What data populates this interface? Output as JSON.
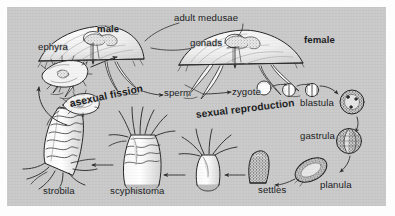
{
  "figure": {
    "panel_background": "#c9c9c9",
    "ink_color": "#1a1a1a",
    "paper_background": "#fdfdfd"
  },
  "labels": {
    "ephyra": {
      "text": "ephyra",
      "style": "regular",
      "x": 38,
      "y": 42
    },
    "male": {
      "text": "male",
      "style": "bold",
      "x": 97,
      "y": 24
    },
    "adult_medusae": {
      "text": "adult medusae",
      "style": "regular",
      "x": 174,
      "y": 13
    },
    "gonads": {
      "text": "gonads",
      "style": "regular",
      "x": 190,
      "y": 38
    },
    "female": {
      "text": "female",
      "style": "bold",
      "x": 304,
      "y": 35
    },
    "sperm": {
      "text": "sperm",
      "style": "regular",
      "x": 164,
      "y": 88
    },
    "zygote": {
      "text": "zygote",
      "style": "regular",
      "x": 232,
      "y": 87
    },
    "blastula": {
      "text": "blastula",
      "style": "regular",
      "x": 300,
      "y": 98
    },
    "gastrula": {
      "text": "gastrula",
      "style": "regular",
      "x": 300,
      "y": 131
    },
    "planula": {
      "text": "planula",
      "style": "regular",
      "x": 320,
      "y": 180
    },
    "settles": {
      "text": "settles",
      "style": "regular",
      "x": 258,
      "y": 185
    },
    "scyphistoma": {
      "text": "scyphistoma",
      "style": "regular",
      "x": 110,
      "y": 193
    },
    "strobila": {
      "text": "strobila",
      "style": "regular",
      "x": 43,
      "y": 193
    },
    "asexual_fission": {
      "text": "asexual fission",
      "style": "bigbold",
      "x": 70,
      "y": 99
    },
    "sexual_reproduction": {
      "text": "sexual reproduction",
      "style": "bigbold",
      "x": 196,
      "y": 110
    }
  },
  "stages": [
    {
      "name": "adult medusa male",
      "kind": "medusa"
    },
    {
      "name": "adult medusa female",
      "kind": "medusa"
    },
    {
      "name": "sperm",
      "kind": "gamete"
    },
    {
      "name": "zygote",
      "kind": "cell"
    },
    {
      "name": "two-cell stage",
      "kind": "cleavage"
    },
    {
      "name": "four-cell stage",
      "kind": "cleavage"
    },
    {
      "name": "blastula",
      "kind": "embryo"
    },
    {
      "name": "gastrula",
      "kind": "embryo"
    },
    {
      "name": "planula",
      "kind": "larva"
    },
    {
      "name": "settled planula",
      "kind": "larva"
    },
    {
      "name": "young polyp",
      "kind": "polyp"
    },
    {
      "name": "scyphistoma",
      "kind": "polyp"
    },
    {
      "name": "strobila",
      "kind": "polyp"
    },
    {
      "name": "ephyra",
      "kind": "juvenile-medusa"
    }
  ]
}
